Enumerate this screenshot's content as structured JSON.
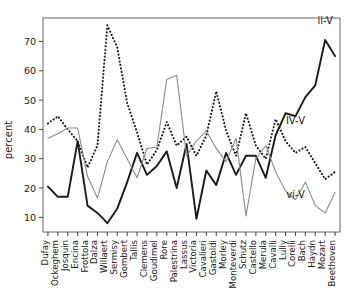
{
  "chart_data": {
    "type": "line",
    "title": "",
    "xlabel": "",
    "ylabel": "percent",
    "ylim": [
      5,
      78
    ],
    "yticks": [
      10,
      20,
      30,
      40,
      50,
      60,
      70
    ],
    "grid": false,
    "legend_position": "inline-annotations",
    "categories": [
      "Dufay",
      "Ockeghem",
      "Josquin",
      "Encina",
      "Frottola",
      "Dalza",
      "Willaert",
      "Sermisy",
      "Gombert",
      "Tallis",
      "Clemens",
      "Goudimel",
      "Rore",
      "Palestrina",
      "Lassus",
      "Victoria",
      "Cavalieri",
      "Gastoldi",
      "Morley",
      "Monteverdi",
      "Schutz",
      "Castello",
      "Merula",
      "Cavalli",
      "Lully",
      "Corelli",
      "Bach",
      "Haydn",
      "Mozart",
      "Beethoven"
    ],
    "series": [
      {
        "name": "ii-V",
        "style": "solid-thick",
        "color": "#1a1a1a",
        "values": [
          20.5,
          17.0,
          17.0,
          36.0,
          14.0,
          11.5,
          8.0,
          13.0,
          22.0,
          32.0,
          24.5,
          27.5,
          32.5,
          20.0,
          35.0,
          9.5,
          26.0,
          21.0,
          32.0,
          24.5,
          31.0,
          31.0,
          23.5,
          38.0,
          45.5,
          44.5,
          51.0,
          55.0,
          70.5,
          65.0
        ]
      },
      {
        "name": "IV-V",
        "style": "dotted",
        "color": "#1a1a1a",
        "values": [
          42.0,
          44.5,
          40.0,
          36.0,
          27.0,
          34.5,
          75.5,
          68.0,
          49.0,
          39.0,
          28.0,
          33.0,
          42.5,
          34.5,
          37.5,
          31.0,
          38.0,
          53.0,
          39.5,
          31.0,
          45.5,
          34.5,
          30.0,
          43.5,
          36.0,
          32.0,
          34.0,
          28.5,
          23.0,
          25.5
        ]
      },
      {
        "name": "vi-V",
        "style": "solid-thin",
        "color": "#8c8c8c",
        "values": [
          37.0,
          38.5,
          40.5,
          40.5,
          24.0,
          16.5,
          29.0,
          36.5,
          30.0,
          23.5,
          33.5,
          34.0,
          57.0,
          58.5,
          31.0,
          36.0,
          39.5,
          33.5,
          29.0,
          37.0,
          10.5,
          30.0,
          34.5,
          25.5,
          19.0,
          16.0,
          22.0,
          14.0,
          11.5,
          18.5
        ]
      }
    ],
    "annotations": [
      {
        "text": "ii-V",
        "x_index": 28,
        "y_value": 76.0
      },
      {
        "text": "IV-V",
        "x_index": 25,
        "y_value": 42.0
      },
      {
        "text": "vi-V",
        "x_index": 25,
        "y_value": 16.5
      }
    ]
  },
  "axes": {
    "ylabel": "percent",
    "ytick_labels": [
      "10",
      "20",
      "30",
      "40",
      "50",
      "60",
      "70"
    ],
    "xtick_labels": [
      "Dufay",
      "Ockeghem",
      "Josquin",
      "Encina",
      "Frottola",
      "Dalza",
      "Willaert",
      "Sermisy",
      "Gombert",
      "Tallis",
      "Clemens",
      "Goudimel",
      "Rore",
      "Palestrina",
      "Lassus",
      "Victoria",
      "Cavalieri",
      "Gastoldi",
      "Morley",
      "Monteverdi",
      "Schutz",
      "Castello",
      "Merula",
      "Cavalli",
      "Lully",
      "Corelli",
      "Bach",
      "Haydn",
      "Mozart",
      "Beethoven"
    ]
  }
}
